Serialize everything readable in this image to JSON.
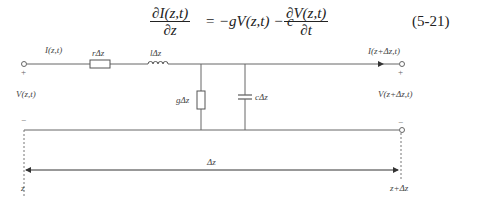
{
  "equation": {
    "lhs_numerator": "∂I(z,t)",
    "lhs_denominator": "∂z",
    "middle": "= −gV(z,t) − c",
    "rhs_numerator": "∂V(z,t)",
    "rhs_denominator": "∂t",
    "number": "(5-21)"
  },
  "circuit": {
    "input_current": "I(z,t)",
    "output_current": "I(z+Δz,t)",
    "series_resistor": "rΔz",
    "series_inductor": "lΔz",
    "shunt_conductance": "gΔz",
    "shunt_capacitor": "cΔz",
    "input_voltage": "V(z,t)",
    "output_voltage": "V(z+Δz,t)",
    "plus_sign": "+",
    "minus_sign": "−"
  },
  "dimension": {
    "length_label": "Δz",
    "start_label": "z",
    "end_label": "z+Δz"
  },
  "colors": {
    "wire": "#555555",
    "text": "#222222"
  }
}
